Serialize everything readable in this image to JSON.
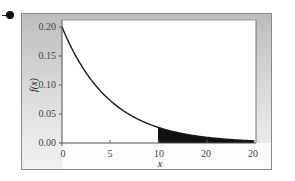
{
  "chart_data": {
    "type": "area",
    "title": "",
    "xlabel": "x",
    "ylabel": "f(x)",
    "function": "f(x) = 0.2·e^(-0.2x)",
    "xlim": [
      0,
      20
    ],
    "ylim": [
      0,
      0.2
    ],
    "x_ticks": [
      "0",
      "5",
      "10",
      "20",
      "20"
    ],
    "y_ticks": [
      "0.00",
      "0.05",
      "0.10",
      "0.15",
      "0.20"
    ],
    "series": [
      {
        "name": "f(x)",
        "x": [
          0,
          2,
          4,
          6,
          8,
          10,
          12,
          14,
          16,
          18,
          20
        ],
        "values": [
          0.2,
          0.134,
          0.09,
          0.06,
          0.04,
          0.027,
          0.018,
          0.012,
          0.008,
          0.005,
          0.004
        ]
      }
    ],
    "shaded_region": {
      "from_x": 10,
      "to_x": 20,
      "color": "#111111"
    },
    "grid": false,
    "legend": "none"
  },
  "labels": {
    "x_ticks": [
      "0",
      "5",
      "10",
      "20",
      "20"
    ],
    "y_ticks": [
      "0.20",
      "0.15",
      "0.10",
      "0.05",
      "0.00"
    ],
    "xlabel": "x",
    "ylabel": "f(x)"
  },
  "colors": {
    "curve": "#1a1a1a",
    "shade": "#111111",
    "frame_gradient_top": "#bdbdbd",
    "frame_gradient_bottom": "#f2f2f2",
    "plot_bg": "#ffffff"
  }
}
